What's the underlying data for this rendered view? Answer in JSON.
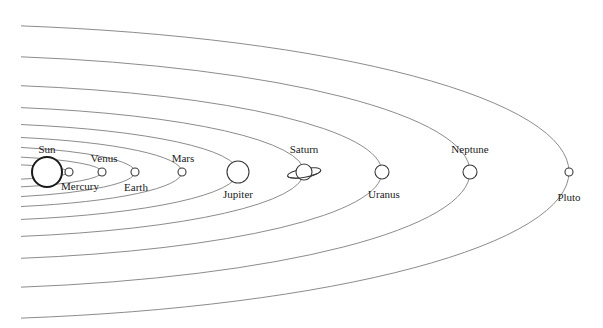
{
  "diagram": {
    "center_y": 172,
    "left_x": 21,
    "orbits": [
      {
        "name": "mercury-orbit",
        "right_x": 69,
        "half_height": 8
      },
      {
        "name": "venus-orbit",
        "right_x": 102,
        "half_height": 16
      },
      {
        "name": "earth-orbit",
        "right_x": 135,
        "half_height": 26
      },
      {
        "name": "mars-orbit",
        "right_x": 182,
        "half_height": 36
      },
      {
        "name": "jupiter-orbit",
        "right_x": 238,
        "half_height": 49
      },
      {
        "name": "saturn-orbit",
        "right_x": 304,
        "half_height": 66
      },
      {
        "name": "uranus-orbit",
        "right_x": 382,
        "half_height": 88
      },
      {
        "name": "neptune-orbit",
        "right_x": 470,
        "half_height": 117
      },
      {
        "name": "pluto-orbit",
        "right_x": 569,
        "half_height": 148
      }
    ],
    "bodies": [
      {
        "name": "Sun",
        "x": 47,
        "r": 15,
        "label_x": 47,
        "label_y": 153,
        "type": "sun"
      },
      {
        "name": "Mercury",
        "x": 69,
        "r": 4,
        "label_x": 80,
        "label_y": 190,
        "type": "planet"
      },
      {
        "name": "Venus",
        "x": 102,
        "r": 4,
        "label_x": 104,
        "label_y": 162,
        "type": "planet"
      },
      {
        "name": "Earth",
        "x": 135,
        "r": 4,
        "label_x": 136,
        "label_y": 191,
        "type": "planet"
      },
      {
        "name": "Mars",
        "x": 182,
        "r": 4,
        "label_x": 183,
        "label_y": 162,
        "type": "planet"
      },
      {
        "name": "Jupiter",
        "x": 238,
        "r": 11,
        "label_x": 238,
        "label_y": 198,
        "type": "planet"
      },
      {
        "name": "Saturn",
        "x": 304,
        "r": 8,
        "label_x": 304,
        "label_y": 153,
        "type": "saturn"
      },
      {
        "name": "Uranus",
        "x": 382,
        "r": 7,
        "label_x": 384,
        "label_y": 198,
        "type": "planet"
      },
      {
        "name": "Neptune",
        "x": 470,
        "r": 7,
        "label_x": 470,
        "label_y": 153,
        "type": "planet"
      },
      {
        "name": "Pluto",
        "x": 569,
        "r": 4,
        "label_x": 569,
        "label_y": 201,
        "type": "planet"
      }
    ],
    "colors": {
      "orbit": "#8c8c8c",
      "outline": "#3a3a3a",
      "background": "#ffffff"
    }
  }
}
